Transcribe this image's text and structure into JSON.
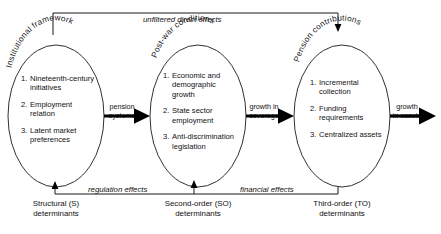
{
  "diagram": {
    "title": "unfiltered direct effects",
    "nodes": [
      {
        "arc_label": "Institutional framework",
        "items": [
          {
            "num": "1.",
            "text": "Nineteenth-century initiatives"
          },
          {
            "num": "2.",
            "text": "Employment relation"
          },
          {
            "num": "3.",
            "text": "Latent market preferences"
          }
        ],
        "caption_line1": "Structural (S)",
        "caption_line2": "determinants"
      },
      {
        "arc_label": "Post-war conditions",
        "items": [
          {
            "num": "1.",
            "text": "Economic and demographic growth"
          },
          {
            "num": "2.",
            "text": "State sector employment"
          },
          {
            "num": "3.",
            "text": "Anti-discrimination legislation"
          }
        ],
        "caption_line1": "Second-order (SO)",
        "caption_line2": "determinants"
      },
      {
        "arc_label": "Pension contributions",
        "items": [
          {
            "num": "1.",
            "text": "Incremental collection"
          },
          {
            "num": "2.",
            "text": "Funding requirements"
          },
          {
            "num": "3.",
            "text": "Centralized assets"
          }
        ],
        "caption_line1": "Third-order (TO)",
        "caption_line2": "determinants"
      }
    ],
    "flow_arrows": [
      {
        "top": "pension",
        "bottom": "systems"
      },
      {
        "top": "growth in",
        "bottom": "coverage"
      },
      {
        "top": "growth",
        "bottom": "in assets"
      }
    ],
    "feedback": {
      "top_effect": "unfiltered direct effects",
      "regulation_effect": "regulation effects",
      "financial_effect": "financial effects"
    },
    "colors": {
      "stroke": "#1a1a1a",
      "arrow": "#000000",
      "background": "#ffffff"
    }
  }
}
